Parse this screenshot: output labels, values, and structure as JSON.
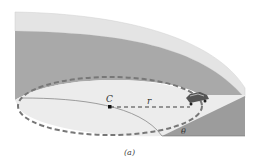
{
  "diagram": {
    "type": "banked curve",
    "labels": {
      "center": "C",
      "radius": "r",
      "angle": "θ"
    },
    "caption": "(a)",
    "colors": {
      "rim_top": "#e6e6e6",
      "bank_surface": "#aaaaaa",
      "floor": "#f0f0f0",
      "wedge": "#9a9a9a",
      "dashed_path": "#777777"
    }
  }
}
